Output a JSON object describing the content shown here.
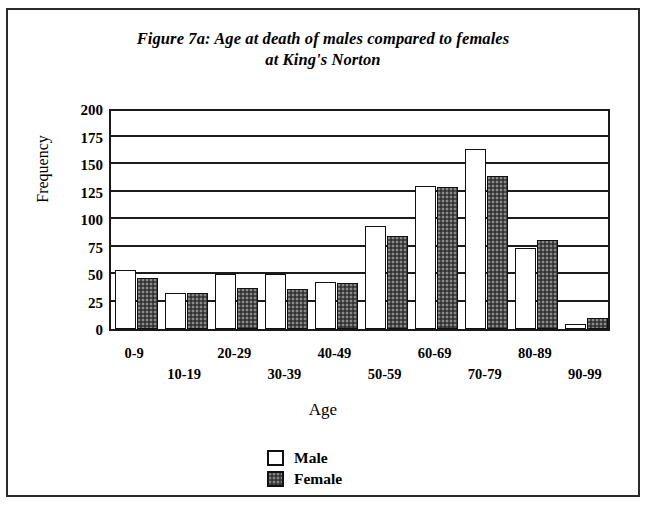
{
  "figure": {
    "title_line1": "Figure 7a: Age at death of males compared to females",
    "title_line2": "at King's Norton"
  },
  "legend": {
    "male_label": "Male",
    "female_label": "Female"
  },
  "axes": {
    "y_title": "Frequency",
    "x_title": "Age"
  },
  "colors": {
    "male_fill": "#ffffff",
    "female_fill": "#4a4a4a",
    "outline": "#111111",
    "frame": "#2b2b2b"
  },
  "chart_data": {
    "type": "bar",
    "title": "Figure 7a: Age at death of males compared to females at King's Norton",
    "xlabel": "Age",
    "ylabel": "Frequency",
    "ylim": [
      0,
      200
    ],
    "yticks": [
      0,
      25,
      50,
      75,
      100,
      125,
      150,
      175,
      200
    ],
    "grid": true,
    "legend_position": "bottom-center",
    "categories": [
      "0-9",
      "10-19",
      "20-29",
      "30-39",
      "40-49",
      "50-59",
      "60-69",
      "70-79",
      "80-89",
      "90-99"
    ],
    "series": [
      {
        "name": "Male",
        "values": [
          54,
          33,
          50,
          50,
          43,
          94,
          130,
          164,
          74,
          5
        ]
      },
      {
        "name": "Female",
        "values": [
          46,
          33,
          37,
          36,
          42,
          85,
          129,
          139,
          81,
          10
        ]
      }
    ]
  }
}
